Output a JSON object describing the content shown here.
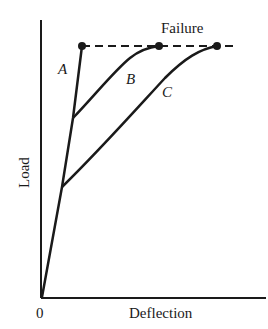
{
  "diagram": {
    "title_annotation": "Failure",
    "axes": {
      "y_label": "Load",
      "x_label": "Deflection",
      "origin_label": "0"
    },
    "curves": [
      {
        "name": "A",
        "label": "A",
        "description": "Steep linear load-deflection line from origin to failure"
      },
      {
        "name": "B",
        "label": "B",
        "description": "Branches from line A at high load, curves to failure"
      },
      {
        "name": "C",
        "label": "C",
        "description": "Branches from line A at lower load, curves to failure at largest deflection"
      }
    ],
    "failure_line": {
      "style": "dashed",
      "label": "Failure"
    },
    "colors": {
      "ink": "#1a1a1a",
      "background": "#ffffff"
    }
  }
}
